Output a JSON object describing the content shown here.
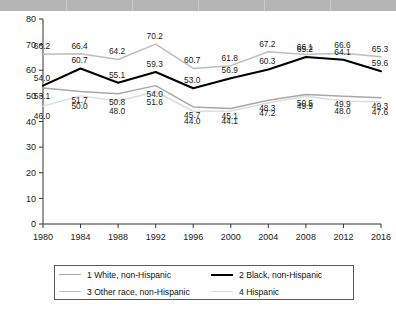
{
  "chart_data": {
    "type": "line",
    "title": "",
    "xlabel": "",
    "ylabel": "",
    "x": [
      1980,
      1984,
      1988,
      1992,
      1996,
      2000,
      2004,
      2008,
      2012,
      2016
    ],
    "xtick_labels": [
      "1980",
      "1984",
      "1988",
      "1992",
      "1996",
      "2000",
      "2004",
      "2008",
      "2012",
      "2016"
    ],
    "ylim": [
      0,
      80
    ],
    "ytick_labels": [
      "0",
      "10",
      "20",
      "30",
      "40",
      "50",
      "60",
      "70",
      "80"
    ],
    "ytick_values": [
      0,
      10,
      20,
      30,
      40,
      50,
      60,
      70,
      80
    ],
    "grid": false,
    "legend_position": "bottom",
    "series": [
      {
        "name": "1 White, non-Hispanic",
        "color": "#a8a8a8",
        "values": [
          53.1,
          51.7,
          50.8,
          54.0,
          45.7,
          45.1,
          48.3,
          50.5,
          49.9,
          49.3
        ],
        "labels": [
          "53.1",
          "51.7",
          "50.8",
          "54.0",
          "45.7",
          "45.1",
          "48.3",
          "50.5",
          "49.9",
          "49.3"
        ]
      },
      {
        "name": "2 Black, non-Hispanic",
        "color": "#000000",
        "values": [
          54.0,
          60.7,
          55.1,
          59.3,
          53.0,
          56.9,
          60.3,
          65.2,
          64.1,
          59.6
        ],
        "labels": [
          "54.0",
          "60.7",
          "55.1",
          "59.3",
          "53.0",
          "56.9",
          "60.3",
          "65.2",
          "64.1",
          "59.6"
        ]
      },
      {
        "name": "3 Other race, non-Hispanic",
        "color": "#bdbdbd",
        "values": [
          66.2,
          66.4,
          64.2,
          70.2,
          60.7,
          61.8,
          67.2,
          66.1,
          66.6,
          65.3
        ],
        "labels": [
          "66.2",
          "66.4",
          "64.2",
          "70.2",
          "60.7",
          "61.8",
          "67.2",
          "66.1",
          "66.6",
          "65.3"
        ]
      },
      {
        "name": "4 Hispanic",
        "color": "#dcdcdc",
        "values": [
          46.0,
          50.0,
          48.0,
          51.6,
          44.0,
          44.1,
          47.2,
          49.9,
          48.0,
          47.6
        ],
        "labels": [
          "46.0",
          "50.0",
          "48.0",
          "51.6",
          "44.0",
          "44.1",
          "47.2",
          "49.9",
          "48.0",
          "47.6"
        ]
      }
    ]
  },
  "legend": {
    "items": [
      {
        "label": "1 White, non-Hispanic"
      },
      {
        "label": "2 Black, non-Hispanic"
      },
      {
        "label": "3 Other race, non-Hispanic"
      },
      {
        "label": "4 Hispanic"
      }
    ]
  }
}
